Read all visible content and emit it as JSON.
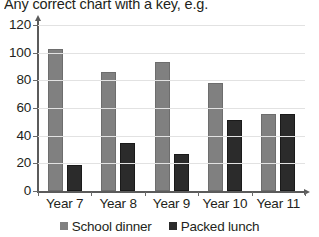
{
  "chart_data": {
    "type": "bar",
    "title": "Any correct chart with a key, e.g.",
    "xlabel": "",
    "ylabel": "",
    "ylim": [
      0,
      120
    ],
    "ytick_step": 20,
    "yticks": [
      0,
      20,
      40,
      60,
      80,
      100,
      120
    ],
    "ytick_labels": [
      "0",
      "20",
      "40",
      "60",
      "80",
      "100",
      "120"
    ],
    "categories": [
      "Year 7",
      "Year 8",
      "Year 9",
      "Year 10",
      "Year 11"
    ],
    "series": [
      {
        "name": "School dinner",
        "color": "#808080",
        "values": [
          103,
          86,
          93,
          78,
          56
        ]
      },
      {
        "name": "Packed lunch",
        "color": "#2b2b2b",
        "values": [
          19,
          35,
          27,
          51,
          56
        ]
      }
    ],
    "grid": true,
    "grid_axis": "y",
    "legend_position": "bottom",
    "axis_color": "#5b5b5b",
    "grid_color": "#e2e2e2"
  }
}
